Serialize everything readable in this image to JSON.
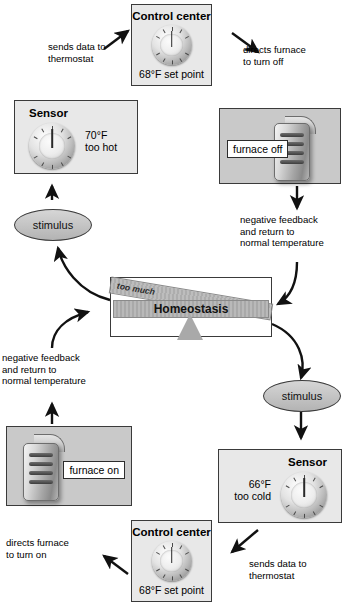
{
  "diagram": {
    "center": {
      "box_label": "Homeostasis",
      "left_label": "too much",
      "right_label": "too little"
    },
    "top_loop": {
      "control_center": {
        "title": "Control center",
        "detail": "68°F set point",
        "icon": "thermostat-dial-icon"
      },
      "sensor": {
        "title": "Sensor",
        "reading": "70°F",
        "state": "too hot",
        "icon": "thermostat-dial-icon"
      },
      "effector": {
        "tag": "furnace off",
        "icon": "furnace-icon"
      },
      "stimulus": "stimulus",
      "captions": {
        "sends_data": "sends data to\nthermostat",
        "directs_furnace": "directs furnace\nto turn off",
        "negative_feedback": "negative feedback\nand return to\nnormal temperature"
      }
    },
    "bottom_loop": {
      "control_center": {
        "title": "Control center",
        "detail": "68°F set point",
        "icon": "thermostat-dial-icon"
      },
      "sensor": {
        "title": "Sensor",
        "reading": "66°F",
        "state": "too cold",
        "icon": "thermostat-dial-icon"
      },
      "effector": {
        "tag": "furnace on",
        "icon": "furnace-icon"
      },
      "stimulus": "stimulus",
      "captions": {
        "sends_data": "sends data to\nthermostat",
        "directs_furnace": "directs furnace\nto turn on",
        "negative_feedback": "negative feedback\nand return to\nnormal temperature"
      }
    },
    "dial_numbers": [
      "50",
      "60",
      "70",
      "80",
      "90"
    ],
    "colors": {
      "panel_light": "#e8e8e8",
      "panel_gray": "#c9c9c9",
      "border": "#3a3a3a",
      "bar": "#b3b3b3",
      "background": "#ffffff"
    }
  }
}
